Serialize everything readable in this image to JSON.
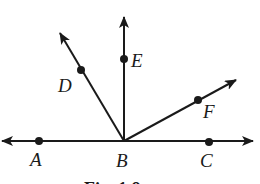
{
  "diagram": {
    "type": "rays-from-point",
    "vertex": {
      "name": "B",
      "x": 124,
      "y": 141
    },
    "stroke_color": "#1a1a1a",
    "background": "#ffffff",
    "lines": [
      {
        "id": "line-AC",
        "from": [
          2,
          141
        ],
        "to": [
          253,
          141
        ],
        "arrows": [
          "start",
          "end"
        ],
        "description": "line through A, B, C"
      }
    ],
    "rays": [
      {
        "id": "ray-BD",
        "from": [
          124,
          141
        ],
        "to": [
          60,
          33
        ],
        "arrows": [
          "end"
        ]
      },
      {
        "id": "ray-BE",
        "from": [
          124,
          141
        ],
        "to": [
          124,
          17
        ],
        "arrows": [
          "end"
        ]
      },
      {
        "id": "ray-BF",
        "from": [
          124,
          141
        ],
        "to": [
          236,
          80
        ],
        "arrows": [
          "end"
        ]
      }
    ],
    "points": [
      {
        "name": "A",
        "x": 39,
        "y": 141,
        "label_x": 30,
        "label_y": 166
      },
      {
        "name": "B",
        "x": 124,
        "y": 141,
        "label_x": 116,
        "label_y": 167,
        "dot": false
      },
      {
        "name": "C",
        "x": 209,
        "y": 142,
        "label_x": 200,
        "label_y": 167
      },
      {
        "name": "D",
        "x": 81,
        "y": 70,
        "label_x": 58,
        "label_y": 92
      },
      {
        "name": "E",
        "x": 124,
        "y": 59,
        "label_x": 131,
        "label_y": 67
      },
      {
        "name": "F",
        "x": 198,
        "y": 100,
        "label_x": 203,
        "label_y": 118
      }
    ],
    "caption": {
      "text": "Fig. 1.8",
      "x": 84,
      "y": 195
    }
  },
  "labels": {
    "A": "A",
    "B": "B",
    "C": "C",
    "D": "D",
    "E": "E",
    "F": "F",
    "caption": "Fig. 1.8"
  }
}
